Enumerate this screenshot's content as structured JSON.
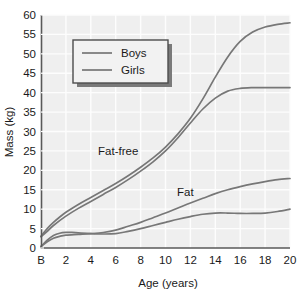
{
  "chart_data": {
    "type": "line",
    "title": "",
    "xlabel": "Age (years)",
    "ylabel": "Mass (kg)",
    "xlim": [
      0,
      20
    ],
    "ylim": [
      0,
      60
    ],
    "grid": true,
    "xticks": [
      "B",
      "2",
      "4",
      "6",
      "8",
      "10",
      "12",
      "14",
      "16",
      "18",
      "20"
    ],
    "xtick_values": [
      0,
      2,
      4,
      6,
      8,
      10,
      12,
      14,
      16,
      18,
      20
    ],
    "yticks": [
      "0",
      "5",
      "10",
      "15",
      "20",
      "25",
      "30",
      "35",
      "40",
      "45",
      "50",
      "55",
      "60"
    ],
    "ytick_values": [
      0,
      5,
      10,
      15,
      20,
      25,
      30,
      35,
      40,
      45,
      50,
      55,
      60
    ],
    "legend": {
      "position": "upper-left",
      "entries": [
        "Boys",
        "Girls"
      ]
    },
    "annotations": [
      {
        "text": "Fat-free",
        "x": 6.2,
        "y": 24.0
      },
      {
        "text": "Fat",
        "x": 11.6,
        "y": 13.5
      }
    ],
    "series": [
      {
        "name": "Fat-free mass, Boys",
        "group": "Fat-free",
        "sex": "Boys",
        "color": "#777777",
        "x": [
          0,
          0.5,
          1,
          2,
          3,
          4,
          5,
          6,
          7,
          8,
          9,
          10,
          11,
          12,
          13,
          14,
          15,
          16,
          17,
          18,
          19,
          20
        ],
        "y": [
          3.0,
          5.0,
          6.6,
          9.2,
          11.2,
          13.0,
          14.8,
          16.6,
          18.6,
          20.8,
          23.2,
          26.0,
          29.4,
          33.4,
          38.4,
          44.0,
          49.2,
          53.2,
          55.6,
          56.9,
          57.6,
          58.0
        ]
      },
      {
        "name": "Fat-free mass, Girls",
        "group": "Fat-free",
        "sex": "Girls",
        "color": "#777777",
        "x": [
          0,
          0.5,
          1,
          2,
          3,
          4,
          5,
          6,
          7,
          8,
          9,
          10,
          11,
          12,
          13,
          14,
          15,
          16,
          17,
          18,
          19,
          20
        ],
        "y": [
          2.9,
          4.3,
          5.8,
          8.2,
          10.2,
          12.0,
          13.8,
          15.6,
          17.6,
          19.8,
          22.2,
          25.0,
          28.4,
          32.2,
          35.8,
          38.6,
          40.4,
          41.1,
          41.3,
          41.3,
          41.3,
          41.3
        ]
      },
      {
        "name": "Fat mass, Girls",
        "group": "Fat",
        "sex": "Girls",
        "color": "#777777",
        "x": [
          0,
          0.5,
          1,
          1.5,
          2,
          3,
          4,
          5,
          6,
          7,
          8,
          9,
          10,
          11,
          12,
          13,
          14,
          15,
          16,
          17,
          18,
          19,
          20
        ],
        "y": [
          0.4,
          1.6,
          2.5,
          3.0,
          3.3,
          3.5,
          3.7,
          4.0,
          4.6,
          5.6,
          6.6,
          7.8,
          9.0,
          10.3,
          11.6,
          12.8,
          14.0,
          15.0,
          15.8,
          16.5,
          17.1,
          17.6,
          17.9
        ]
      },
      {
        "name": "Fat mass, Boys",
        "group": "Fat",
        "sex": "Boys",
        "color": "#777777",
        "x": [
          0,
          0.5,
          1,
          1.5,
          2,
          2.5,
          3,
          4,
          5,
          6,
          7,
          8,
          9,
          10,
          11,
          12,
          13,
          14,
          15,
          16,
          17,
          18,
          19,
          20
        ],
        "y": [
          0.4,
          2.0,
          3.2,
          3.8,
          4.0,
          4.0,
          3.9,
          3.7,
          3.6,
          3.7,
          4.3,
          5.0,
          5.8,
          6.6,
          7.4,
          8.1,
          8.7,
          9.0,
          9.0,
          8.9,
          8.9,
          9.0,
          9.4,
          10.0
        ]
      }
    ],
    "colors": {
      "plot_background": "#efefef",
      "gridline": "#fdfdfd",
      "axis": "#595959",
      "curve": "#777777",
      "text": "#1a1a1a",
      "legend_background": "#f2f2f2",
      "legend_border": "#4d4d4d",
      "legend_shadow": "#7a7a7a"
    }
  }
}
